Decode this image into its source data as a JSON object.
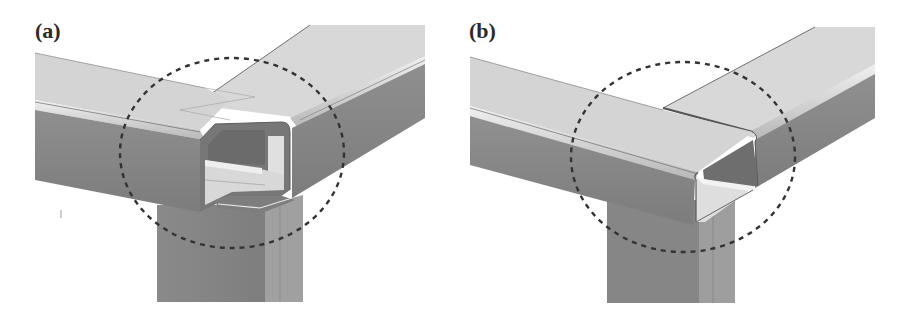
{
  "figure": {
    "panels": [
      {
        "id": "a",
        "label": "(a)",
        "description": "Square-tube frame corner joint: two horizontal rectangular tubes meeting at a vertical post, with an open notched cut-out (C-shaped profile) at the joint, highlighted by a dashed circle"
      },
      {
        "id": "b",
        "label": "(b)",
        "description": "Square-tube frame corner joint: horizontal rectangular tube butted against a perpendicular tube with an open C-section end over a vertical post, highlighted by a dashed circle"
      }
    ],
    "colors": {
      "top_face": "#d6d6d6",
      "top_face_light": "#dedede",
      "side_face": "#8e8e8e",
      "side_face_dark": "#7d7d7d",
      "post_face": "#888888",
      "post_side": "#a2a2a2",
      "inner_light": "#e2e2e2",
      "inner_dark": "#707070",
      "edge": "#5a5a5a",
      "highlight_circle": "#3a3a3a",
      "background": "#ffffff"
    }
  }
}
